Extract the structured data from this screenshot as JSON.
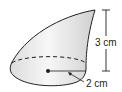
{
  "figure": {
    "shape": "oblique cone",
    "height_label": "3 cm",
    "radius_label": "2 cm",
    "colors": {
      "stroke": "#231f20",
      "fill_light": "#f4f4f4",
      "fill_shade": "#d9d9d9"
    }
  }
}
